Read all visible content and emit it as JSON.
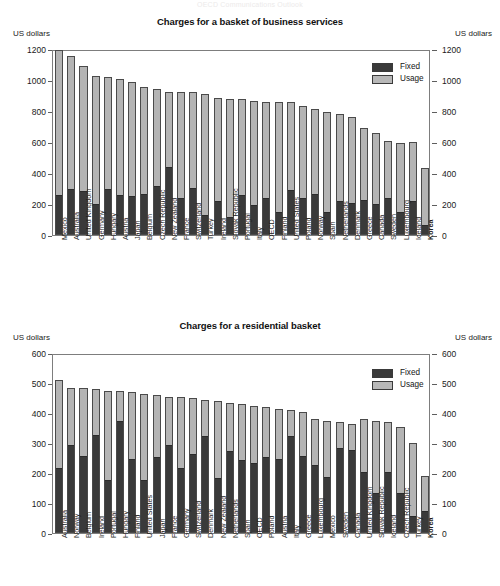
{
  "faint_header": "OECD Communications Outlook",
  "units_label": "US dollars",
  "legend": {
    "fixed": "Fixed",
    "usage": "Usage"
  },
  "colors": {
    "fixed": "#3a3a3a",
    "usage": "#b4b4b4",
    "axis": "#7d7d7d",
    "background": "#ffffff"
  },
  "chart_data": [
    {
      "type": "bar",
      "id": "business",
      "title": "Charges for a basket of business services",
      "xlabel": "",
      "ylabel": "US dollars",
      "ylim": [
        0,
        1200
      ],
      "yticks": [
        0,
        200,
        400,
        600,
        800,
        1000,
        1200
      ],
      "grid": false,
      "stacked": true,
      "legend_position": "top-right",
      "legend_entries": [
        "Fixed",
        "Usage"
      ],
      "categories": [
        "Mexico",
        "Australia",
        "United Kingdom",
        "Germany",
        "Hungary",
        "Austria",
        "Japan",
        "Belgium",
        "Czech Republic",
        "New Zealand",
        "France",
        "Switzerland",
        "Turkey",
        "Ireland",
        "Slovak Republic",
        "Portugal",
        "Italy",
        "OECD",
        "Finland",
        "United States",
        "Poland",
        "Norway",
        "Spain",
        "Netherlands",
        "Denmark",
        "Greece",
        "Canada",
        "Sweden",
        "Luxembourg",
        "Iceland",
        "Korea"
      ],
      "highlight_category": "Korea",
      "series": [
        {
          "name": "Fixed",
          "values": [
            250,
            290,
            280,
            195,
            290,
            250,
            245,
            255,
            310,
            435,
            235,
            300,
            120,
            215,
            110,
            250,
            190,
            230,
            140,
            285,
            235,
            255,
            140,
            215,
            200,
            220,
            195,
            230,
            145,
            215,
            60
          ]
        },
        {
          "name": "Usage",
          "values": [
            945,
            865,
            810,
            830,
            730,
            755,
            745,
            700,
            635,
            485,
            690,
            620,
            790,
            670,
            765,
            625,
            675,
            630,
            720,
            575,
            600,
            555,
            655,
            565,
            560,
            470,
            465,
            375,
            450,
            385,
            370
          ]
        }
      ],
      "totals": [
        1195,
        1155,
        1090,
        1025,
        1020,
        1005,
        990,
        955,
        945,
        920,
        925,
        920,
        910,
        885,
        875,
        875,
        865,
        860,
        860,
        860,
        835,
        810,
        795,
        780,
        760,
        690,
        660,
        605,
        595,
        600,
        430
      ]
    },
    {
      "type": "bar",
      "id": "residential",
      "title": "Charges for a residential basket",
      "xlabel": "",
      "ylabel": "US dollars",
      "ylim": [
        0,
        600
      ],
      "yticks": [
        0,
        100,
        200,
        300,
        400,
        500,
        600
      ],
      "grid": false,
      "stacked": true,
      "legend_position": "top-right",
      "legend_entries": [
        "Fixed",
        "Usage"
      ],
      "categories": [
        "Australia",
        "Norway",
        "Belgium",
        "Ireland",
        "Portugal",
        "Hungary",
        "Finland",
        "United States",
        "Japan",
        "France",
        "Germany",
        "Switzerland",
        "Denmark",
        "New Zealand",
        "Netherlands",
        "Spain",
        "OECD",
        "Poland",
        "Austria",
        "Italy",
        "Greece",
        "Luxembourg",
        "Mexico",
        "Sweden",
        "Canada",
        "United Kingdom",
        "Slovak Republic",
        "Iceland",
        "Czech Republic",
        "Turkey",
        "Korea"
      ],
      "highlight_category": "Korea",
      "series": [
        {
          "name": "Fixed",
          "values": [
            215,
            290,
            255,
            325,
            175,
            370,
            245,
            175,
            250,
            290,
            215,
            260,
            320,
            180,
            270,
            240,
            230,
            250,
            245,
            320,
            255,
            225,
            185,
            280,
            275,
            200,
            130,
            200,
            130,
            55,
            70
          ]
        },
        {
          "name": "Usage",
          "values": [
            295,
            195,
            230,
            155,
            300,
            105,
            225,
            290,
            210,
            165,
            240,
            190,
            125,
            260,
            165,
            190,
            195,
            170,
            170,
            90,
            150,
            155,
            190,
            90,
            90,
            180,
            245,
            170,
            225,
            245,
            120
          ]
        }
      ],
      "totals": [
        510,
        485,
        485,
        480,
        475,
        475,
        470,
        465,
        460,
        455,
        455,
        450,
        445,
        440,
        435,
        430,
        425,
        420,
        415,
        410,
        405,
        380,
        375,
        370,
        365,
        380,
        375,
        370,
        355,
        300,
        190
      ]
    }
  ]
}
